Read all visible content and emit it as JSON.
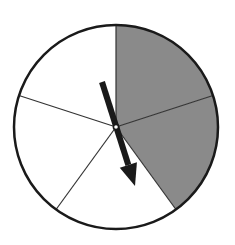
{
  "spinner": {
    "center": [
      116,
      127
    ],
    "radius": 102,
    "sector_count": 5,
    "sectors": [
      {
        "index": 0,
        "start_deg": 0,
        "end_deg": 72,
        "shaded": true
      },
      {
        "index": 1,
        "start_deg": 72,
        "end_deg": 144,
        "shaded": true
      },
      {
        "index": 2,
        "start_deg": 144,
        "end_deg": 216,
        "shaded": false
      },
      {
        "index": 3,
        "start_deg": 216,
        "end_deg": 288,
        "shaded": false
      },
      {
        "index": 4,
        "start_deg": 288,
        "end_deg": 360,
        "shaded": false
      }
    ],
    "shaded_count": 2,
    "colors": {
      "shaded": "#8a8a8a",
      "unshaded": "#ffffff",
      "outline": "#1a1a1a",
      "divider": "#333333",
      "arrow": "#1a1a1a"
    },
    "arrow": {
      "tail": [
        102,
        82
      ],
      "tip": [
        135,
        186
      ]
    }
  }
}
